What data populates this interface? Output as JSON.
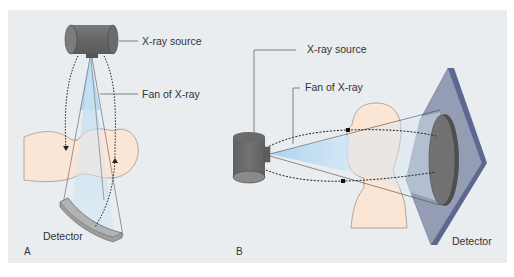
{
  "figure": {
    "background": "#e9edf0",
    "colors": {
      "source_body": "#6b6b6b",
      "source_end": "#858585",
      "xray_fan": "#b9dcf2",
      "skin": "#fbe6d6",
      "detector_face": "#8f97b0",
      "detector_edge": "#5d6890",
      "detector_circle": "#6e6e6e",
      "leader_line": "#555555",
      "dotted_path": "#222222"
    },
    "panels": [
      {
        "id": "A",
        "panel_label": "A",
        "labels": {
          "source": "X-ray source",
          "fan": "Fan of X-ray",
          "detector": "Detector"
        }
      },
      {
        "id": "B",
        "panel_label": "B",
        "labels": {
          "source": "X-ray source",
          "fan": "Fan of X-ray",
          "detector": "Detector"
        }
      }
    ]
  }
}
